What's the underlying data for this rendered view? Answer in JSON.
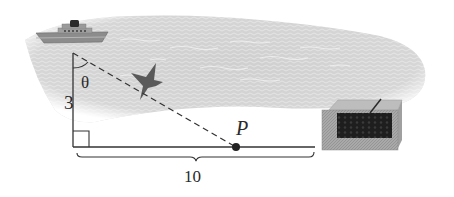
{
  "figure": {
    "type": "right-triangle-word-problem-illustration",
    "labels": {
      "angle": "θ",
      "vertical_side": "3",
      "point": "P",
      "horizontal_length": "10"
    },
    "objects": {
      "ship": "ship-on-water",
      "bird": "bird-in-flight",
      "box": "wooden-crate"
    },
    "colors": {
      "line": "#333333",
      "sea": "#c9c9c9",
      "sea_light": "#e2e2e2",
      "ship_hull": "#8a8a8a",
      "ship_funnel": "#2b2b2b",
      "bird": "#555555",
      "box_side": "#a8a8a8",
      "box_top": "#b9b9b9",
      "box_grille": "#222222",
      "point": "#222222"
    }
  }
}
